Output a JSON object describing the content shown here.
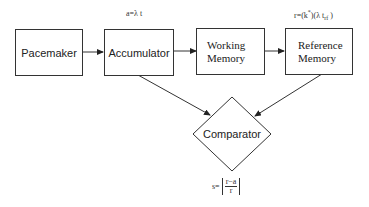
{
  "diagram": {
    "nodes": [
      {
        "id": "pacemaker",
        "label": "Pacemaker",
        "shape": "rectangle"
      },
      {
        "id": "accumulator",
        "label": "Accumulator",
        "shape": "rectangle",
        "annotation": "a=λ t"
      },
      {
        "id": "working_memory",
        "label_line1": "Working",
        "label_line2": "Memory",
        "shape": "rectangle"
      },
      {
        "id": "reference_memory",
        "label_line1": "Reference",
        "label_line2": "Memory",
        "shape": "rectangle",
        "annotation": "r=(k*)(λ t"
      },
      {
        "id": "comparator",
        "label": "Comparator",
        "shape": "diamond"
      }
    ],
    "edges": [
      {
        "from": "pacemaker",
        "to": "accumulator"
      },
      {
        "from": "accumulator",
        "to": "working_memory"
      },
      {
        "from": "working_memory",
        "to": "reference_memory"
      },
      {
        "from": "accumulator",
        "to": "comparator"
      },
      {
        "from": "reference_memory",
        "to": "comparator"
      }
    ],
    "annotations": {
      "accumulator_formula": "a=λ t",
      "reference_formula_main": "r=(k",
      "reference_formula_sup": "*",
      "reference_formula_mid": ")(λ t",
      "reference_formula_sub": "rf",
      "reference_formula_end": " )",
      "comparator_formula_prefix": "s=",
      "comparator_formula_numerator": "r−a",
      "comparator_formula_denominator": "r"
    }
  }
}
